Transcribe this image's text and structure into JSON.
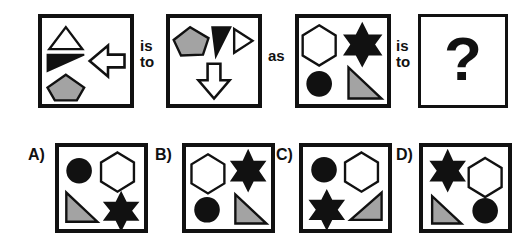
{
  "colors": {
    "ink": "#111111",
    "paper": "#ffffff",
    "gray_fill": "#a3a3a3",
    "black_fill": "#111111"
  },
  "connectors": [
    {
      "name": "is-to-1",
      "line1": "is",
      "line2": "to"
    },
    {
      "name": "as",
      "line1": "as",
      "line2": ""
    },
    {
      "name": "is-to-2",
      "line1": "is",
      "line2": "to"
    }
  ],
  "analogy": {
    "panel_a": {
      "label": "panel-a",
      "shapes": [
        {
          "name": "triangle-outline",
          "shape": "triangle-up",
          "fill": "white",
          "position": "top-left"
        },
        {
          "name": "right-triangle-black",
          "shape": "right-triangle",
          "fill": "black",
          "position": "mid-left"
        },
        {
          "name": "pentagon-gray",
          "shape": "pentagon",
          "fill": "gray",
          "position": "bottom-left"
        },
        {
          "name": "arrow-left-outline",
          "shape": "arrow-left",
          "fill": "white",
          "position": "right"
        }
      ]
    },
    "panel_b": {
      "label": "panel-b",
      "shapes": [
        {
          "name": "pentagon-gray",
          "shape": "pentagon",
          "fill": "gray",
          "position": "top-left"
        },
        {
          "name": "right-triangle-black",
          "shape": "right-triangle",
          "fill": "black",
          "position": "top-center"
        },
        {
          "name": "triangle-right-outline",
          "shape": "triangle-right",
          "fill": "white",
          "position": "top-right"
        },
        {
          "name": "arrow-down-outline",
          "shape": "arrow-down",
          "fill": "white",
          "position": "bottom-center"
        }
      ]
    },
    "panel_c": {
      "label": "panel-c",
      "shapes": [
        {
          "name": "hexagon-outline",
          "shape": "hexagon",
          "fill": "white",
          "position": "top-left"
        },
        {
          "name": "star-black",
          "shape": "star6",
          "fill": "black",
          "position": "top-right"
        },
        {
          "name": "circle-black",
          "shape": "circle",
          "fill": "black",
          "position": "bottom-left"
        },
        {
          "name": "right-triangle-gray",
          "shape": "right-triangle",
          "fill": "gray",
          "position": "bottom-right"
        }
      ]
    },
    "panel_d": {
      "label": "panel-question",
      "question_mark": "?"
    }
  },
  "options": [
    {
      "letter": "A)",
      "name": "option-a",
      "shapes": [
        {
          "name": "circle-black",
          "shape": "circle",
          "fill": "black",
          "position": "top-left"
        },
        {
          "name": "hexagon-outline",
          "shape": "hexagon",
          "fill": "white",
          "position": "top-right"
        },
        {
          "name": "right-triangle-gray",
          "shape": "right-triangle",
          "fill": "gray",
          "position": "bottom-left"
        },
        {
          "name": "star-black",
          "shape": "star6",
          "fill": "black",
          "position": "bottom-right"
        }
      ]
    },
    {
      "letter": "B)",
      "name": "option-b",
      "shapes": [
        {
          "name": "hexagon-outline",
          "shape": "hexagon",
          "fill": "white",
          "position": "top-left"
        },
        {
          "name": "star-black",
          "shape": "star6",
          "fill": "black",
          "position": "top-right"
        },
        {
          "name": "circle-black",
          "shape": "circle",
          "fill": "black",
          "position": "bottom-left"
        },
        {
          "name": "right-triangle-gray",
          "shape": "right-triangle",
          "fill": "gray",
          "position": "bottom-right"
        }
      ]
    },
    {
      "letter": "C)",
      "name": "option-c",
      "shapes": [
        {
          "name": "circle-black",
          "shape": "circle",
          "fill": "black",
          "position": "top-left"
        },
        {
          "name": "hexagon-outline",
          "shape": "hexagon",
          "fill": "white",
          "position": "top-right"
        },
        {
          "name": "star-black",
          "shape": "star6",
          "fill": "black",
          "position": "bottom-left"
        },
        {
          "name": "right-triangle-gray-flipped",
          "shape": "right-triangle-flipped",
          "fill": "gray",
          "position": "bottom-right"
        }
      ]
    },
    {
      "letter": "D)",
      "name": "option-d",
      "shapes": [
        {
          "name": "star-black",
          "shape": "star6",
          "fill": "black",
          "position": "top-left"
        },
        {
          "name": "hexagon-outline",
          "shape": "hexagon",
          "fill": "white",
          "position": "top-right"
        },
        {
          "name": "right-triangle-gray",
          "shape": "right-triangle",
          "fill": "gray",
          "position": "bottom-left"
        },
        {
          "name": "circle-black",
          "shape": "circle",
          "fill": "black",
          "position": "bottom-right"
        }
      ]
    }
  ]
}
